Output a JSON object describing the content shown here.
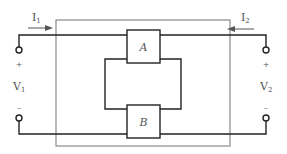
{
  "diagram": {
    "type": "two-port network",
    "port1": {
      "current_label": "I",
      "current_sub": "1",
      "voltage_label": "V",
      "voltage_sub": "1",
      "plus": "+",
      "minus": "–"
    },
    "port2": {
      "current_label": "I",
      "current_sub": "2",
      "voltage_label": "V",
      "voltage_sub": "2",
      "plus": "+",
      "minus": "–"
    },
    "blocks": [
      {
        "label": "A"
      },
      {
        "label": "B"
      }
    ],
    "connection": "parallel",
    "colors": {
      "wire": "#222222",
      "outer_box": "#888888",
      "text": "#555555"
    }
  }
}
